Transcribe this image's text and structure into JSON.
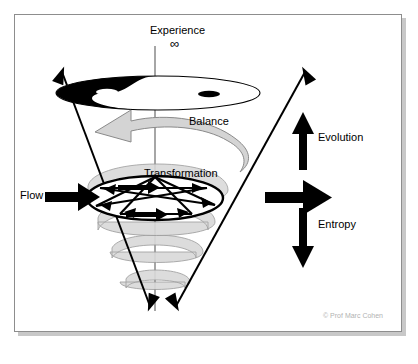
{
  "diagram": {
    "title_label": "Experience",
    "infinity_symbol": "∞",
    "labels": {
      "experience": "Experience",
      "balance": "Balance",
      "transformation": "Transformation",
      "evolution": "Evolution",
      "entropy": "Entropy",
      "flow": "Flow"
    },
    "credit": "© Prof Marc Cohen",
    "icons": {
      "yin_yang": "yin-yang-icon",
      "pentagram": "pentagram-icon",
      "spiral": "spiral-icon",
      "cone": "cone-icon",
      "up_arrow": "up-arrow-icon",
      "down_arrow": "down-arrow-icon",
      "right_arrow": "right-arrow-icon",
      "flow_arrow": "flow-arrow-icon",
      "rotation_arrow": "curved-rotation-arrow-icon"
    },
    "colors": {
      "ink": "#000000",
      "frame": "#8d8d8d",
      "shadow": "#bebebe",
      "spiral_fill": "#d9d9d9",
      "spiral_stroke": "#9a9a9a",
      "balance_fill": "#d4d4d4",
      "balance_stroke": "#8a8a8a",
      "credit": "#b2b2b2",
      "background": "#ffffff"
    }
  }
}
